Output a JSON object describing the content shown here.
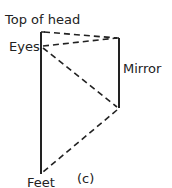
{
  "diagram": {
    "labels": {
      "top_of_head": "Top of head",
      "eyes": "Eyes",
      "mirror": "Mirror",
      "feet": "Feet",
      "panel": "(c)"
    },
    "colors": {
      "line": "#222222",
      "text": "#222222"
    }
  }
}
